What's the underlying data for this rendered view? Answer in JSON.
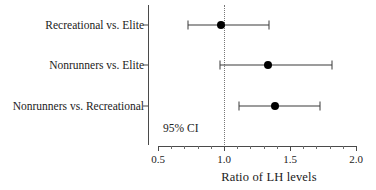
{
  "chart_data": {
    "type": "scatter",
    "subtype": "forest-plot",
    "title": "",
    "xlabel": "Ratio of LH levels",
    "ylabel": "",
    "xlim": [
      0.5,
      2.0
    ],
    "xticks": [
      0.5,
      1.0,
      1.5,
      2.0
    ],
    "xtick_labels": [
      "0.5",
      "1.0",
      "1.5",
      "2.0"
    ],
    "xminor_step": 0.1,
    "grid": false,
    "legend": null,
    "reference_line": {
      "value": 1.0,
      "style": "dotted",
      "color": "#777777"
    },
    "annotations": [
      {
        "text": "95% CI",
        "x": 0.54,
        "y": -0.55
      }
    ],
    "categories": [
      "Recreational vs. Elite",
      "Nonrunners vs. Elite",
      "Nonrunners vs. Recreational"
    ],
    "points": [
      {
        "label": "Recreational vs. Elite",
        "estimate": 0.98,
        "ci_low": 0.73,
        "ci_high": 1.34
      },
      {
        "label": "Nonrunners vs. Elite",
        "estimate": 1.33,
        "ci_low": 0.97,
        "ci_high": 1.82
      },
      {
        "label": "Nonrunners vs. Recreational",
        "estimate": 1.39,
        "ci_low": 1.11,
        "ci_high": 1.73
      }
    ],
    "marker_color": "#000000",
    "line_color": "#3a3a3a"
  },
  "axis": {
    "x_title": "Ratio of LH levels",
    "tick_labels": [
      "0.5",
      "1.0",
      "1.5",
      "2.0"
    ]
  },
  "annotation": {
    "ci_text": "95% CI"
  },
  "rows": [
    {
      "label": "Recreational vs. Elite"
    },
    {
      "label": "Nonrunners vs. Elite"
    },
    {
      "label": "Nonrunners vs. Recreational"
    }
  ]
}
